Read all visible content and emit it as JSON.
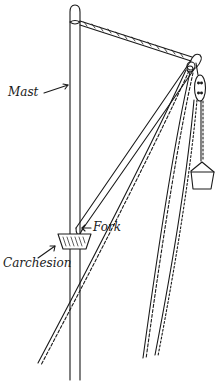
{
  "diagram": {
    "labels": {
      "mast": "Mast",
      "fork": "Fork",
      "carchesion": "Carchesion"
    },
    "colors": {
      "ink": "#1a1a1a",
      "background": "#ffffff"
    },
    "parts": [
      "mast",
      "stay-rope",
      "yard",
      "pulley-block",
      "bucket",
      "carchesion",
      "fork",
      "hauling-ropes"
    ]
  }
}
